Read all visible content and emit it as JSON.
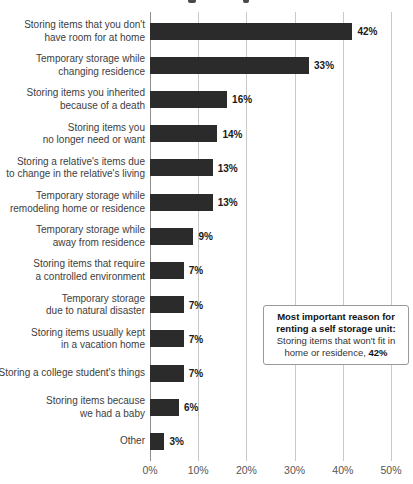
{
  "page": {
    "background_color": "#ffffff"
  },
  "chart_data": {
    "type": "bar",
    "orientation": "horizontal",
    "bar_color": "#2b2b2b",
    "grid": true,
    "xlim": [
      0,
      50
    ],
    "x_ticks": [
      {
        "value": 0,
        "label": "0%"
      },
      {
        "value": 10,
        "label": "10%"
      },
      {
        "value": 20,
        "label": "20%"
      },
      {
        "value": 30,
        "label": "30%"
      },
      {
        "value": 40,
        "label": "40%"
      },
      {
        "value": 50,
        "label": "50%"
      }
    ],
    "categories": [
      "Storing items that you don't have room for at home",
      "Temporary storage while changing residence",
      "Storing items you inherited because of a death",
      "Storing items you no longer need or want",
      "Storing a relative's items due to change in the relative's living",
      "Temporary storage while remodeling home or residence",
      "Temporary storage while away from residence",
      "Storing items that require a controlled environment",
      "Temporary storage due to natural disaster",
      "Storing items usually kept in a vacation home",
      "Storing a college student's things",
      "Storing items because we had a baby",
      "Other"
    ],
    "category_lines": [
      [
        "Storing items that you don't",
        "have room for at home"
      ],
      [
        "Temporary storage while",
        "changing residence"
      ],
      [
        "Storing items you inherited",
        "because of a death"
      ],
      [
        "Storing items you",
        "no longer need or want"
      ],
      [
        "Storing a relative's items due",
        "to change in the relative's living"
      ],
      [
        "Temporary storage while",
        "remodeling home or residence"
      ],
      [
        "Temporary storage while",
        "away from residence"
      ],
      [
        "Storing items that require",
        "a controlled environment"
      ],
      [
        "Temporary storage",
        "due to natural disaster"
      ],
      [
        "Storing items usually kept",
        "in a vacation home"
      ],
      [
        "Storing a college student's things"
      ],
      [
        "Storing items because",
        "we had a baby"
      ],
      [
        "Other"
      ]
    ],
    "values": [
      42,
      33,
      16,
      14,
      13,
      13,
      9,
      7,
      7,
      7,
      7,
      6,
      3
    ],
    "value_labels": [
      "42%",
      "33%",
      "16%",
      "14%",
      "13%",
      "13%",
      "9%",
      "7%",
      "7%",
      "7%",
      "7%",
      "6%",
      "3%"
    ],
    "annotation": {
      "bold_line_1": "Most important reason for",
      "bold_line_2": "renting a self storage unit:",
      "normal_line_1": "Storing items that won't fit in",
      "normal_line_2_prefix": "home or residence, ",
      "normal_line_2_value": "42%"
    }
  }
}
